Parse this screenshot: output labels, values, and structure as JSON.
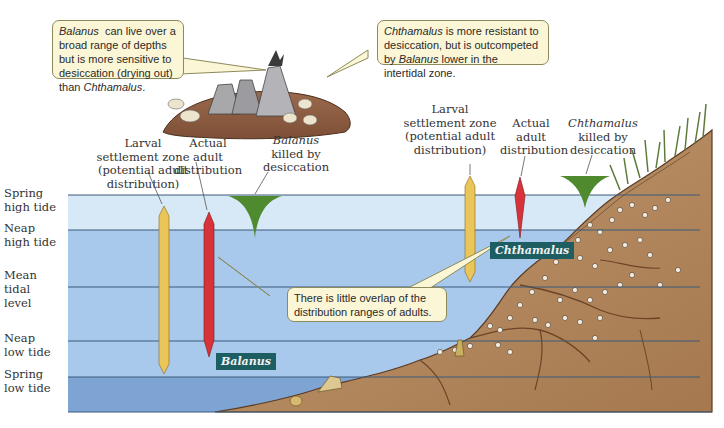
{
  "figure": {
    "callouts": {
      "balanus_note": {
        "species": "Balanus",
        "text_a": "can live over a broad range of depths but is more sensitive to desiccation (drying out) than",
        "species2": "Chthamalus",
        "text_b": "."
      },
      "chthamalus_note": {
        "species": "Chthamalus",
        "text_a": "is more resistant to desiccation, but is outcompeted by",
        "species2": "Balanus",
        "text_b": "lower in the intertidal zone."
      },
      "overlap_note": {
        "text": "There is little overlap of the distribution ranges of adults."
      }
    },
    "tide_levels": [
      {
        "line1": "Spring",
        "line2": "high tide"
      },
      {
        "line1": "Neap",
        "line2": "high tide"
      },
      {
        "line1": "Mean",
        "line2": "tidal",
        "line3": "level"
      },
      {
        "line1": "Neap",
        "line2": "low tide"
      },
      {
        "line1": "Spring",
        "line2": "low tide"
      }
    ],
    "balanus_group": {
      "larval_label": [
        "Larval",
        "settlement zone",
        "(potential adult",
        "distribution)"
      ],
      "adult_label": [
        "Actual",
        "adult",
        "distribution"
      ],
      "killed_label": {
        "species": "Balanus",
        "line2": "killed by",
        "line3": "desiccation"
      },
      "species_tag": "Balanus"
    },
    "chthamalus_group": {
      "larval_label": [
        "Larval",
        "settlement zone",
        "(potential adult",
        "distribution)"
      ],
      "adult_label": [
        "Actual",
        "adult",
        "distribution"
      ],
      "killed_label": {
        "species": "Chthamalus",
        "line2": "killed by",
        "line3": "desiccation"
      },
      "species_tag": "Chthamalus"
    },
    "colors": {
      "spring_high_band": "#d7e9f7",
      "water_band": "#a9c9ec",
      "deep_band": "#7ea4d4",
      "larval_bar": "#eac55a",
      "adult_bar": "#d8333a",
      "killed_marker": "#4f8a2f",
      "rock": "#b0845a",
      "species_tag_bg": "#1d5e63",
      "callout_bg": "#fbf6d6"
    }
  }
}
